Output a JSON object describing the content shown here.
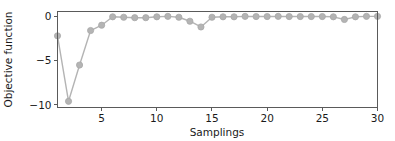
{
  "chart_data": {
    "type": "line",
    "title": "",
    "xlabel": "Samplings",
    "ylabel": "Objective function",
    "xlim": [
      1,
      30
    ],
    "ylim": [
      -10.3,
      0.55
    ],
    "xticks": [
      5,
      10,
      15,
      20,
      25,
      30
    ],
    "xticklabels": [
      "5",
      "10",
      "15",
      "20",
      "25",
      "30"
    ],
    "yticks": [
      0,
      -5,
      -10
    ],
    "yticklabels": [
      "0",
      "−5",
      "−10"
    ],
    "grid": false,
    "legend": null,
    "marker": "circle",
    "series": [
      {
        "name": "objective",
        "color": "#b4b4b4",
        "x": [
          1,
          2,
          3,
          4,
          5,
          6,
          7,
          8,
          9,
          10,
          11,
          12,
          13,
          14,
          15,
          16,
          17,
          18,
          19,
          20,
          21,
          22,
          23,
          24,
          25,
          26,
          27,
          28,
          29,
          30
        ],
        "values": [
          -2.2,
          -9.6,
          -5.5,
          -1.6,
          -1.0,
          -0.05,
          -0.1,
          -0.15,
          -0.15,
          -0.05,
          0.0,
          -0.1,
          -0.55,
          -1.2,
          -0.1,
          -0.05,
          -0.05,
          0.0,
          -0.02,
          -0.02,
          0.0,
          -0.02,
          -0.02,
          -0.02,
          -0.02,
          -0.05,
          -0.35,
          -0.05,
          0.0,
          0.0
        ]
      }
    ]
  },
  "axis": {
    "xlabel": "Samplings",
    "ylabel": "Objective function"
  }
}
